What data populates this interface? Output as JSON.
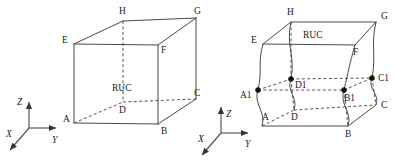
{
  "figure": {
    "background_color": "#ffffff",
    "line_color": "#4a4a4a",
    "hidden_line_color": "#555555",
    "label_color": "#1a1a1a",
    "dot_color": "#111111"
  },
  "panels": [
    {
      "id": "left-panel",
      "name": "straight-edge-ruc-cube",
      "center_label": "RUC",
      "vertices": [
        {
          "key": "E",
          "label": "E",
          "x": 74,
          "y": 44,
          "label_x": 62,
          "label_y": 43,
          "hidden": false
        },
        {
          "key": "H",
          "label": "H",
          "x": 123,
          "y": 21,
          "label_x": 119,
          "label_y": 14,
          "hidden": false
        },
        {
          "key": "G",
          "label": "G",
          "x": 196,
          "y": 18,
          "label_x": 194,
          "label_y": 14,
          "hidden": false
        },
        {
          "key": "F",
          "label": "F",
          "x": 158,
          "y": 45,
          "label_x": 161,
          "label_y": 53,
          "hidden": false
        },
        {
          "key": "A",
          "label": "A",
          "x": 74,
          "y": 123,
          "label_x": 63,
          "label_y": 122,
          "hidden": false
        },
        {
          "key": "D",
          "label": "D",
          "x": 123,
          "y": 102,
          "label_x": 119,
          "label_y": 113,
          "hidden": true
        },
        {
          "key": "C",
          "label": "C",
          "x": 196,
          "y": 99,
          "label_x": 194,
          "label_y": 96,
          "hidden": false
        },
        {
          "key": "B",
          "label": "B",
          "x": 158,
          "y": 124,
          "label_x": 161,
          "label_y": 134,
          "hidden": false
        }
      ],
      "solid_edges": [
        [
          "E",
          "H"
        ],
        [
          "H",
          "G"
        ],
        [
          "E",
          "F"
        ],
        [
          "F",
          "G"
        ],
        [
          "E",
          "A"
        ],
        [
          "F",
          "B"
        ],
        [
          "G",
          "C"
        ],
        [
          "A",
          "B"
        ],
        [
          "B",
          "C"
        ]
      ],
      "hidden_edges": [
        [
          "H",
          "D"
        ],
        [
          "A",
          "D"
        ],
        [
          "D",
          "C"
        ]
      ],
      "ruc_label_x": 112,
      "ruc_label_y": 91,
      "axes": {
        "origin_x": 29,
        "origin_y": 128,
        "z_tip_x": 29,
        "z_tip_y": 102,
        "z_label": "Z",
        "z_label_x": 17,
        "z_label_y": 105,
        "y_tip_x": 56,
        "y_tip_y": 128,
        "y_label": "Y",
        "y_label_x": 52,
        "y_label_y": 143,
        "x_tip_x": 10,
        "x_tip_y": 150,
        "x_label": "X",
        "x_label_x": 6,
        "x_label_y": 137
      }
    },
    {
      "id": "right-panel",
      "name": "wavy-edge-ruc-cube",
      "center_label": "RUC",
      "vertices": [
        {
          "key": "E",
          "label": "E",
          "x": 263,
          "y": 44,
          "label_x": 251,
          "label_y": 43,
          "hidden": false,
          "dot": false
        },
        {
          "key": "H",
          "label": "H",
          "x": 291,
          "y": 22,
          "label_x": 287,
          "label_y": 15,
          "hidden": false,
          "dot": false
        },
        {
          "key": "G",
          "label": "G",
          "x": 376,
          "y": 22,
          "label_x": 381,
          "label_y": 19,
          "hidden": false,
          "dot": false
        },
        {
          "key": "F",
          "label": "F",
          "x": 355,
          "y": 45,
          "label_x": 353,
          "label_y": 55,
          "hidden": false,
          "dot": false
        },
        {
          "key": "A1",
          "label": "A1",
          "x": 258,
          "y": 90,
          "label_x": 240,
          "label_y": 98,
          "hidden": false,
          "dot": true
        },
        {
          "key": "D1",
          "label": "D1",
          "x": 291,
          "y": 79,
          "label_x": 295,
          "label_y": 88,
          "hidden": true,
          "dot": true
        },
        {
          "key": "C1",
          "label": "C1",
          "x": 372,
          "y": 78,
          "label_x": 378,
          "label_y": 81,
          "hidden": false,
          "dot": true
        },
        {
          "key": "B1",
          "label": "B1",
          "x": 344,
          "y": 90,
          "label_x": 344,
          "label_y": 101,
          "hidden": true,
          "dot": true
        },
        {
          "key": "A",
          "label": "A",
          "x": 262,
          "y": 126,
          "label_x": 262,
          "label_y": 120,
          "hidden": false,
          "dot": false
        },
        {
          "key": "D",
          "label": "D",
          "x": 294,
          "y": 110,
          "label_x": 291,
          "label_y": 120,
          "hidden": true,
          "dot": false
        },
        {
          "key": "C",
          "label": "C",
          "x": 376,
          "y": 105,
          "label_x": 381,
          "label_y": 108,
          "hidden": false,
          "dot": false
        },
        {
          "key": "B",
          "label": "B",
          "x": 348,
          "y": 126,
          "label_x": 345,
          "label_y": 137,
          "hidden": false,
          "dot": false
        }
      ],
      "solid_edges": [
        [
          "E",
          "H"
        ],
        [
          "H",
          "G"
        ],
        [
          "E",
          "F"
        ],
        [
          "F",
          "G"
        ],
        [
          "A",
          "B"
        ],
        [
          "B",
          "C"
        ]
      ],
      "hidden_edges": [
        [
          "H",
          "D1"
        ],
        [
          "D1",
          "D"
        ],
        [
          "A1",
          "D1"
        ],
        [
          "D1",
          "C1"
        ],
        [
          "A1",
          "B1"
        ],
        [
          "B1",
          "C1"
        ],
        [
          "A",
          "D"
        ],
        [
          "D",
          "C"
        ],
        [
          "B1",
          "B"
        ],
        [
          "C1",
          "C"
        ]
      ],
      "wavy_edges": [
        {
          "from": "E",
          "to": "A",
          "through": "A1"
        },
        {
          "from": "H",
          "to": "D",
          "through": "D1"
        },
        {
          "from": "F",
          "to": "B",
          "through": "B1"
        },
        {
          "from": "G",
          "to": "C",
          "through": "C1"
        }
      ],
      "ruc_label_x": 303,
      "ruc_label_y": 38,
      "axes": {
        "origin_x": 221,
        "origin_y": 133,
        "z_tip_x": 221,
        "z_tip_y": 107,
        "z_label": "Z",
        "z_label_x": 226,
        "z_label_y": 117,
        "y_tip_x": 248,
        "y_tip_y": 133,
        "y_label": "Y",
        "y_label_x": 245,
        "y_label_y": 147,
        "x_tip_x": 202,
        "x_tip_y": 155,
        "x_label": "X",
        "x_label_x": 198,
        "x_label_y": 142
      }
    }
  ]
}
